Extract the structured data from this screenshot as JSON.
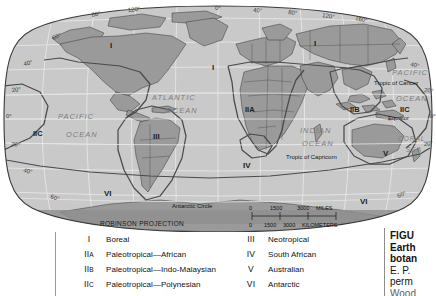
{
  "map": {
    "projection_label": "ROBINSON PROJECTION",
    "ocean_labels": [
      {
        "name": "pacific-ocean-west",
        "line1": "PACIFIC",
        "line2": "OCEAN"
      },
      {
        "name": "atlantic-ocean",
        "line1": "ATLANTIC",
        "line2": "OCEAN"
      },
      {
        "name": "indian-ocean",
        "line1": "INDIAN",
        "line2": "OCEAN"
      },
      {
        "name": "pacific-ocean-east",
        "line1": "PACIFIC",
        "line2": "OCEAN"
      },
      {
        "name": "coral-sea",
        "line1": "CORAL",
        "line2": "SEA"
      }
    ],
    "latitude_lines": [
      {
        "label": "Tropic of Cancer"
      },
      {
        "label": "Equator"
      },
      {
        "label": "Tropic of Capricorn"
      },
      {
        "label": "Antarctic Circle"
      }
    ],
    "lat_ticks_left": [
      "60",
      "40",
      "20",
      "0",
      "20",
      "40",
      "60"
    ],
    "lat_ticks_right": [
      "40",
      "20",
      "0",
      "20",
      "60"
    ],
    "lon_ticks": [
      "80",
      "120",
      "0",
      "40",
      "80",
      "120",
      "160"
    ],
    "degree_symbol": "°",
    "region_labels_on_map": [
      {
        "id": "I",
        "where": "north-america"
      },
      {
        "id": "I",
        "where": "eurasia"
      },
      {
        "id": "I",
        "where": "europe"
      },
      {
        "id": "III",
        "where": "south-america"
      },
      {
        "id": "IIA",
        "where": "africa"
      },
      {
        "id": "IIB",
        "where": "indo-malaysia"
      },
      {
        "id": "IIC",
        "where": "pacific-west"
      },
      {
        "id": "IIC",
        "where": "pacific-east"
      },
      {
        "id": "IV",
        "where": "south-africa"
      },
      {
        "id": "V",
        "where": "australia"
      },
      {
        "id": "VI",
        "where": "antarctic-west"
      },
      {
        "id": "VI",
        "where": "antarctic-east"
      }
    ],
    "scale_bar": {
      "miles": {
        "ticks": [
          "0",
          "1500",
          "3000"
        ],
        "unit": "MILES"
      },
      "kilometers": {
        "ticks": [
          "0",
          "1500",
          "3000"
        ],
        "unit": "KILOMETERS"
      }
    }
  },
  "legend": {
    "left_column": [
      {
        "symbol": "I",
        "sub": "",
        "label": "Boreal"
      },
      {
        "symbol": "II",
        "sub": "A",
        "label": "Paleotropical—African"
      },
      {
        "symbol": "II",
        "sub": "B",
        "label": "Paleotropical—Indo-Malaysian"
      },
      {
        "symbol": "II",
        "sub": "C",
        "label": "Paleotropical—Polynesian"
      }
    ],
    "right_column": [
      {
        "symbol": "III",
        "sub": "",
        "label": "Neotropical"
      },
      {
        "symbol": "IV",
        "sub": "",
        "label": "South African"
      },
      {
        "symbol": "V",
        "sub": "",
        "label": "Australian"
      },
      {
        "symbol": "VI",
        "sub": "",
        "label": "Antarctic"
      }
    ]
  },
  "caption": {
    "lines": [
      {
        "text": "FIGU",
        "bold": true,
        "faded": false
      },
      {
        "text": "Earth",
        "bold": true,
        "faded": false
      },
      {
        "text": "botan",
        "bold": true,
        "faded": false
      },
      {
        "text": "E. P.",
        "bold": false,
        "faded": false
      },
      {
        "text": "perm",
        "bold": false,
        "faded": false
      },
      {
        "text": "Wood",
        "bold": false,
        "faded": true
      }
    ]
  },
  "colors": {
    "land": "#9a9a9a",
    "ocean": "#c9c9c9",
    "map_outline": "#3a3a3a",
    "region_boundary": "#4a4a4a",
    "graticule": "#efefef",
    "country_border": "#2b2b2b",
    "page_background": "#ffffff",
    "projection_band": "#8e8e8e",
    "text": "#111111"
  }
}
